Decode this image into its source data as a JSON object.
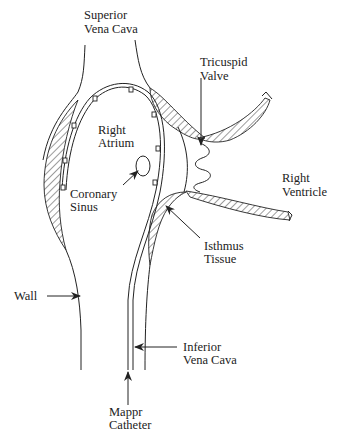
{
  "diagram": {
    "type": "anatomical-schematic",
    "labels": {
      "svc": [
        "Superior",
        "Vena Cava"
      ],
      "tricuspid": [
        "Tricuspid",
        "Valve"
      ],
      "right_atrium": [
        "Right",
        "Atrium"
      ],
      "right_ventricle": [
        "Right",
        "Ventricle"
      ],
      "coronary_sinus": [
        "Coronary",
        "Sinus"
      ],
      "isthmus": [
        "Isthmus",
        "Tissue"
      ],
      "wall": [
        "Wall"
      ],
      "ivc": [
        "Inferior",
        "Vena Cava"
      ],
      "catheter": [
        "Mappr",
        "Catheter"
      ]
    },
    "colors": {
      "ink": "#222222",
      "background": "#ffffff"
    }
  }
}
